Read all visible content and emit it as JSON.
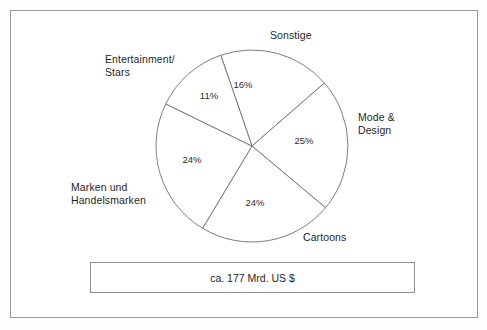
{
  "chart_data": {
    "type": "pie",
    "title": "",
    "subtitle": "",
    "xlabel": "",
    "ylabel": "",
    "legend_position": "none",
    "grid": false,
    "value_suffix": "%",
    "center": {
      "x": 252,
      "y": 146
    },
    "radius": 96,
    "categories": [
      "Sonstige",
      "Mode & Design",
      "Cartoons",
      "Marken und Handelsmarken",
      "Entertainment/Stars"
    ],
    "values": [
      16,
      25,
      24,
      24,
      11
    ],
    "slices": [
      {
        "name": "Sonstige",
        "label": "Sonstige",
        "value": 16,
        "value_text": "16%",
        "start_angle_deg": 41,
        "end_angle_deg": 109,
        "value_label_x": 243,
        "value_label_y": 88
      },
      {
        "name": "Mode & Design",
        "label": "Mode &\nDesign",
        "value": 25,
        "value_text": "25%",
        "start_angle_deg": -40,
        "end_angle_deg": 41,
        "value_label_x": 304,
        "value_label_y": 144
      },
      {
        "name": "Cartoons",
        "label": "Cartoons",
        "value": 24,
        "value_text": "24%",
        "start_angle_deg": -121,
        "end_angle_deg": -40,
        "value_label_x": 255,
        "value_label_y": 206
      },
      {
        "name": "Marken und Handelsmarken",
        "label": "Marken und\nHandelsmarken",
        "value": 24,
        "value_text": "24%",
        "start_angle_deg": 154,
        "end_angle_deg": 239,
        "value_label_x": 192,
        "value_label_y": 163
      },
      {
        "name": "Entertainment/Stars",
        "label": "Entertainment/\nStars",
        "value": 11,
        "value_text": "11%",
        "start_angle_deg": 109,
        "end_angle_deg": 154,
        "value_label_x": 209,
        "value_label_y": 99
      }
    ],
    "annotations": [
      {
        "name": "total",
        "text": "ca. 177 Mrd. US $"
      }
    ],
    "colors": {
      "slice_fill": "#ffffff",
      "slice_stroke": "#6f6f6f",
      "frame_stroke": "#9a9a9a",
      "text": "#1f1f1f",
      "background": "#ffffff"
    }
  },
  "labels": {
    "sonstige": "Sonstige",
    "entertainment": "Entertainment/\nStars",
    "mode_design": "Mode &\nDesign",
    "marken": "Marken und\nHandelsmarken",
    "cartoons": "Cartoons"
  },
  "total_box": {
    "text": "ca. 177 Mrd. US $"
  }
}
